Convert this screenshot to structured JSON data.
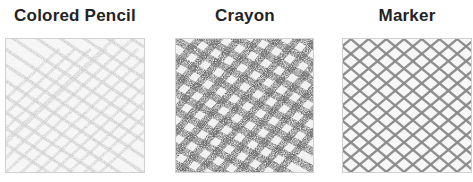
{
  "panels": [
    {
      "title": "Colored Pencil",
      "style": "light thin hatching",
      "stroke_color": "#c4c4c4",
      "background": "#f6f6f6"
    },
    {
      "title": "Crayon",
      "style": "heavy textured crosshatch",
      "stroke_color": "#6e6e6e",
      "background": "#f4f4f4"
    },
    {
      "title": "Marker",
      "style": "crisp diamond crosshatch",
      "stroke_color": "#8a8a8a",
      "background": "#f6f6f6"
    }
  ]
}
